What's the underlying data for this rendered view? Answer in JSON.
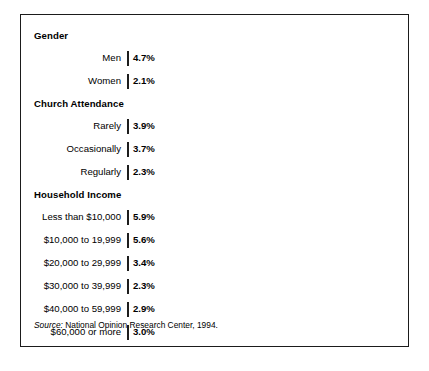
{
  "chart_data": {
    "type": "bar",
    "orientation": "horizontal",
    "title": "",
    "xlabel": "",
    "ylabel": "",
    "xlim": [
      0,
      6.4
    ],
    "grid": false,
    "legend": null,
    "value_suffix": "%",
    "source_note": {
      "prefix": "Source:",
      "text": " National Opinion Research Center, 1994."
    },
    "bar_color": "#878787",
    "bar_border_color": "#1d1d1d",
    "frame_color": "#1b1b1b",
    "groups": [
      {
        "label": "Gender",
        "categories": [
          "Men",
          "Women"
        ],
        "values": [
          4.7,
          2.1
        ],
        "value_labels": [
          "4.7%",
          "2.1%"
        ]
      },
      {
        "label": "Church Attendance",
        "categories": [
          "Rarely",
          "Occasionally",
          "Regularly"
        ],
        "values": [
          3.9,
          3.7,
          2.3
        ],
        "value_labels": [
          "3.9%",
          "3.7%",
          "2.3%"
        ]
      },
      {
        "label": "Household Income",
        "categories": [
          "Less than $10,000",
          "$10,000 to 19,999",
          "$20,000 to 29,999",
          "$30,000 to 39,999",
          "$40,000 to 59,999",
          "$60,000 or more"
        ],
        "values": [
          5.9,
          5.6,
          3.4,
          2.3,
          2.9,
          3.0
        ],
        "value_labels": [
          "5.9%",
          "5.6%",
          "3.4%",
          "2.3%",
          "2.9%",
          "3.0%"
        ]
      }
    ]
  }
}
